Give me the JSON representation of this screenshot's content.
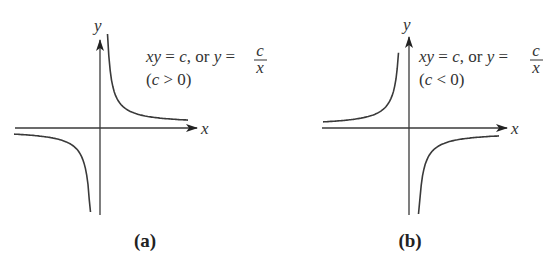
{
  "figure": {
    "panels": [
      {
        "caption": "(a)",
        "x_axis_label": "x",
        "y_axis_label": "y",
        "equation": {
          "lhs": "xy",
          "eq1": " = ",
          "c1": "c",
          "mid": ", or ",
          "y": "y",
          "eq2": " = ",
          "frac_num": "c",
          "frac_den": "x"
        },
        "condition": {
          "open": "(",
          "var": "c",
          "rel": " > 0)"
        },
        "sign": 1
      },
      {
        "caption": "(b)",
        "x_axis_label": "x",
        "y_axis_label": "y",
        "equation": {
          "lhs": "xy",
          "eq1": " = ",
          "c1": "c",
          "mid": ", or ",
          "y": "y",
          "eq2": " = ",
          "frac_num": "c",
          "frac_den": "x"
        },
        "condition": {
          "open": "(",
          "var": "c",
          "rel": " < 0)"
        },
        "sign": -1
      }
    ]
  }
}
